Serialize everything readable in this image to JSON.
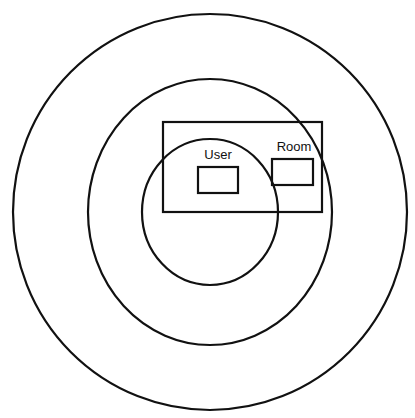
{
  "diagram": {
    "type": "concentric-scope-diagram",
    "colors": {
      "stroke": "#111111",
      "background": "#ffffff"
    },
    "circles": [
      {
        "name": "outer-circle",
        "cx": 210,
        "cy": 212,
        "rx": 197,
        "ry": 198
      },
      {
        "name": "middle-circle",
        "cx": 210,
        "cy": 212,
        "rx": 122,
        "ry": 133
      },
      {
        "name": "inner-circle",
        "cx": 210,
        "cy": 212,
        "rx": 68,
        "ry": 73
      }
    ],
    "container_rect": {
      "x": 163,
      "y": 122,
      "width": 159,
      "height": 90
    },
    "boxes": [
      {
        "label": "User",
        "x": 198,
        "y": 167,
        "width": 40,
        "height": 26,
        "label_x": 218,
        "label_y": 159
      },
      {
        "label": "Room",
        "x": 272,
        "y": 159,
        "width": 41,
        "height": 26,
        "label_x": 294,
        "label_y": 151
      }
    ]
  }
}
